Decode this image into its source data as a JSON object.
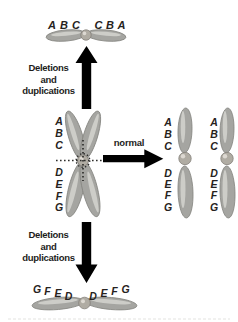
{
  "figure": {
    "background": "#ffffff"
  },
  "colors": {
    "chromosome_fill": "#a5a5a1",
    "chromosome_stroke": "#84847f",
    "chromosome_highlight": "#d3d3cf",
    "centromere_fill": "#b0aca3",
    "centromere_highlight": "#ddd9d2",
    "arrow": "#000000",
    "break_line": "#2e2e2c",
    "label_text": "#262220",
    "faint_rule": "#e3e3e0"
  },
  "top_isochromosome": {
    "labels_left": [
      "A",
      "B",
      "C"
    ],
    "labels_right": [
      "C",
      "B",
      "A"
    ]
  },
  "upper_arrow": {
    "label_line1": "Deletions",
    "label_line2": "and",
    "label_line3": "duplications"
  },
  "center_chromosome": {
    "labels_upper": [
      "A",
      "B",
      "C"
    ],
    "labels_lower": [
      "D",
      "E",
      "F",
      "G"
    ]
  },
  "normal_arrow": {
    "label": "normal"
  },
  "daughter_chromosome_1": {
    "labels_upper": [
      "A",
      "B",
      "C"
    ],
    "labels_lower": [
      "D",
      "E",
      "F",
      "G"
    ]
  },
  "daughter_chromosome_2": {
    "labels_upper": [
      "A",
      "B",
      "C"
    ],
    "labels_lower": [
      "D",
      "E",
      "F",
      "G"
    ]
  },
  "lower_arrow": {
    "label_line1": "Deletions",
    "label_line2": "and",
    "label_line3": "duplications"
  },
  "bottom_isochromosome": {
    "labels_left": [
      "G",
      "F",
      "E",
      "D"
    ],
    "labels_right": [
      "D",
      "E",
      "F",
      "G"
    ]
  }
}
